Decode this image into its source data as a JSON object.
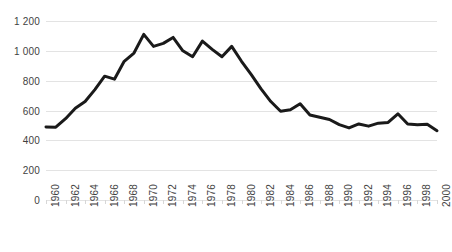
{
  "chart_data": {
    "type": "line",
    "title": "",
    "subtitle": "",
    "xlabel": "",
    "ylabel": "",
    "xlim": [
      1960,
      2000
    ],
    "ylim": [
      0,
      1200
    ],
    "grid": true,
    "legend": null,
    "y_ticks": [
      "0",
      "200",
      "400",
      "600",
      "800",
      "1 000",
      "1 200"
    ],
    "y_tick_values": [
      0,
      200,
      400,
      600,
      800,
      1000,
      1200
    ],
    "x_ticks": [
      "1960",
      "1962",
      "1964",
      "1966",
      "1968",
      "1970",
      "1972",
      "1974",
      "1976",
      "1978",
      "1980",
      "1982",
      "1984",
      "1986",
      "1988",
      "1990",
      "1992",
      "1994",
      "1996",
      "1998",
      "2000"
    ],
    "x_tick_step": 2,
    "x": [
      1960,
      1961,
      1962,
      1963,
      1964,
      1965,
      1966,
      1967,
      1968,
      1969,
      1970,
      1971,
      1972,
      1973,
      1974,
      1975,
      1976,
      1977,
      1978,
      1979,
      1980,
      1981,
      1982,
      1983,
      1984,
      1985,
      1986,
      1987,
      1988,
      1989,
      1990,
      1991,
      1992,
      1993,
      1994,
      1995,
      1996,
      1997,
      1998,
      1999,
      2000
    ],
    "values": [
      490,
      488,
      545,
      615,
      660,
      740,
      830,
      810,
      930,
      985,
      1110,
      1030,
      1050,
      1090,
      1000,
      960,
      1065,
      1010,
      960,
      1030,
      930,
      840,
      745,
      660,
      595,
      605,
      645,
      570,
      555,
      540,
      505,
      483,
      510,
      495,
      515,
      520,
      578,
      510,
      505,
      508,
      465
    ],
    "series": [
      {
        "name": "",
        "color": "#1a1a1a",
        "line_width": 3,
        "values": [
          490,
          488,
          545,
          615,
          660,
          740,
          830,
          810,
          930,
          985,
          1110,
          1030,
          1050,
          1090,
          1000,
          960,
          1065,
          1010,
          960,
          1030,
          930,
          840,
          745,
          660,
          595,
          605,
          645,
          570,
          555,
          540,
          505,
          483,
          510,
          495,
          515,
          520,
          578,
          510,
          505,
          508,
          465
        ]
      }
    ]
  },
  "style": {
    "background": "#ffffff",
    "grid_color": "#e3e3e3",
    "tick_color": "#d7d7d7",
    "text_color": "#3f3f3f",
    "line_color": "#1a1a1a"
  }
}
